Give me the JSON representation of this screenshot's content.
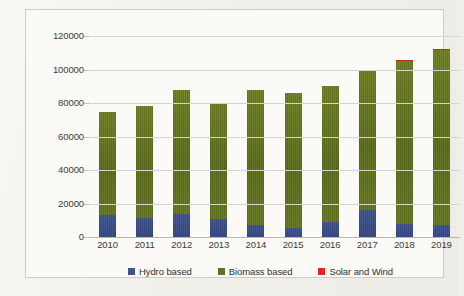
{
  "chart_data": {
    "type": "bar",
    "subtype": "stacked-column",
    "title": "",
    "xlabel": "",
    "ylabel": "",
    "categories": [
      "2010",
      "2011",
      "2012",
      "2013",
      "2014",
      "2015",
      "2016",
      "2017",
      "2018",
      "2019"
    ],
    "ylim": [
      0,
      120000
    ],
    "yticks": [
      0,
      20000,
      40000,
      60000,
      80000,
      100000,
      120000
    ],
    "ytick_labels": [
      "0",
      "20000",
      "40000",
      "60000",
      "80000",
      "100000",
      "120000"
    ],
    "grid": true,
    "legend_position": "bottom",
    "series": [
      {
        "name": "Hydro based",
        "color": "#3e5490",
        "values": [
          13000,
          11500,
          14000,
          11000,
          7000,
          5500,
          9000,
          16000,
          7500,
          7000
        ]
      },
      {
        "name": "Biomass based",
        "color": "#5f7321",
        "values": [
          61500,
          66500,
          74000,
          69000,
          81000,
          80500,
          81000,
          83000,
          97500,
          104500
        ]
      },
      {
        "name": "Solar and Wind",
        "color": "#e8251a",
        "values": [
          0,
          0,
          0,
          0,
          0,
          0,
          0,
          0,
          800,
          1000
        ]
      }
    ],
    "totals": [
      74500,
      78000,
      88000,
      80000,
      88000,
      86000,
      90000,
      99000,
      105800,
      112500
    ]
  },
  "legend": {
    "items": [
      {
        "label": "Hydro based",
        "color": "#3e5490",
        "swatch": "square-swatch"
      },
      {
        "label": "Biomass based",
        "color": "#5f7321",
        "swatch": "square-swatch"
      },
      {
        "label": "Solar and Wind",
        "color": "#e8251a",
        "swatch": "square-swatch"
      }
    ]
  }
}
